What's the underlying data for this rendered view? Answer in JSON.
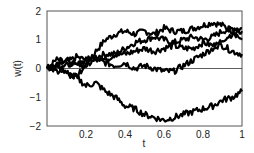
{
  "chart_data": {
    "type": "line",
    "title": "",
    "xlabel": "t",
    "ylabel": "w(t)",
    "xlim": [
      0,
      1
    ],
    "ylim": [
      -2,
      2
    ],
    "xticks": [
      "0.2",
      "0.4",
      "0.6",
      "0.8",
      "1"
    ],
    "yticks": [
      "2",
      "1",
      "0",
      "-1",
      "-2"
    ],
    "grid": false,
    "legend": null,
    "reference_line": {
      "y": 0
    },
    "x": [
      0,
      0.05,
      0.1,
      0.15,
      0.2,
      0.25,
      0.3,
      0.35,
      0.4,
      0.45,
      0.5,
      0.55,
      0.6,
      0.65,
      0.7,
      0.75,
      0.8,
      0.85,
      0.9,
      0.95,
      1.0
    ],
    "series": [
      {
        "name": "path 1",
        "values": [
          0,
          0.1,
          -0.1,
          -0.3,
          0.1,
          0.6,
          1.0,
          1.2,
          1.3,
          1.2,
          1.3,
          1.2,
          1.4,
          1.3,
          1.3,
          1.4,
          1.5,
          1.6,
          1.5,
          1.3,
          1.0
        ]
      },
      {
        "name": "path 2",
        "values": [
          0,
          0.3,
          0.2,
          0.4,
          0.3,
          0.4,
          0.5,
          0.5,
          0.7,
          0.9,
          1.0,
          1.1,
          1.0,
          0.9,
          1.0,
          1.1,
          1.0,
          1.1,
          1.3,
          1.4,
          1.4
        ]
      },
      {
        "name": "path 3",
        "values": [
          0,
          0.2,
          0.3,
          0.1,
          0.3,
          0.4,
          0.3,
          0.5,
          0.5,
          0.6,
          0.7,
          0.6,
          0.7,
          0.8,
          0.7,
          0.7,
          0.9,
          0.8,
          0.8,
          0.6,
          0.5
        ]
      },
      {
        "name": "path 4",
        "values": [
          0,
          -0.1,
          0.1,
          0.2,
          0.1,
          0.3,
          0.2,
          0.1,
          0.2,
          0.0,
          0.1,
          0.0,
          -0.1,
          -0.1,
          0.1,
          0.3,
          0.5,
          0.7,
          1.0,
          1.2,
          1.3
        ]
      },
      {
        "name": "path 5",
        "values": [
          0,
          0.1,
          -0.2,
          -0.3,
          -0.6,
          -0.5,
          -0.8,
          -1.0,
          -1.3,
          -1.4,
          -1.6,
          -1.7,
          -1.8,
          -1.7,
          -1.6,
          -1.5,
          -1.4,
          -1.3,
          -1.1,
          -1.0,
          -0.8
        ]
      }
    ]
  }
}
